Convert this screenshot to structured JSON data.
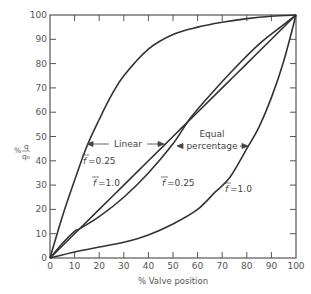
{
  "chart_data": {
    "type": "line",
    "title": "",
    "xlabel": "% Valve position",
    "ylabel": "% q/q0",
    "xlim": [
      0,
      100
    ],
    "ylim": [
      0,
      100
    ],
    "grid": false,
    "xticks": [
      0,
      10,
      20,
      30,
      40,
      50,
      60,
      70,
      80,
      90,
      100
    ],
    "yticks": [
      0,
      10,
      20,
      30,
      40,
      50,
      60,
      70,
      80,
      90,
      100
    ],
    "series": [
      {
        "name": "Linear, f=0.25",
        "group": "Linear",
        "x": [
          0,
          5,
          10,
          15,
          20,
          25,
          30,
          40,
          50,
          60,
          70,
          80,
          90,
          100
        ],
        "y": [
          0,
          17,
          32,
          46,
          57,
          67,
          75,
          86,
          92,
          95,
          97,
          98.5,
          99.5,
          100
        ]
      },
      {
        "name": "Linear, f=1.0",
        "group": "Linear",
        "x": [
          0,
          10,
          20,
          30,
          40,
          50,
          60,
          70,
          80,
          90,
          100
        ],
        "y": [
          0,
          10,
          20,
          30,
          40,
          50,
          60,
          70,
          80,
          90,
          100
        ]
      },
      {
        "name": "Equal percentage, f=0.25",
        "group": "Equal percentage",
        "x": [
          0,
          5,
          10,
          12,
          20,
          30,
          40,
          50,
          57,
          65,
          75,
          85,
          95,
          100
        ],
        "y": [
          0,
          6,
          11,
          12,
          17,
          25,
          35,
          47,
          57.5,
          67,
          78,
          88,
          96,
          100
        ]
      },
      {
        "name": "Equal percentage, f=1.0",
        "group": "Equal percentage",
        "x": [
          0,
          10,
          20,
          30,
          40,
          50,
          60,
          67,
          73,
          80,
          85,
          90,
          95,
          100
        ],
        "y": [
          0,
          2.5,
          4.5,
          6.5,
          9.5,
          14,
          20,
          27,
          33,
          45,
          54,
          66,
          81,
          100
        ]
      }
    ],
    "annotations": [
      {
        "text": "Linear",
        "x": 32,
        "y": 47.5,
        "arrows": "both"
      },
      {
        "text": "Equal",
        "x": 70,
        "y": 53
      },
      {
        "text": "percentage",
        "x": 70,
        "y": 48.5,
        "arrows": "both"
      },
      {
        "text": "f̄=0.25",
        "x": 8,
        "y": 42,
        "series": "Linear, f=0.25"
      },
      {
        "text": "f̄=1.0",
        "x": 13,
        "y": 33,
        "series": "Linear, f=1.0"
      },
      {
        "text": "f̄=0.25",
        "x": 48,
        "y": 32,
        "series": "Equal percentage, f=0.25"
      },
      {
        "text": "f̄=1.0",
        "x": 72,
        "y": 28.5,
        "series": "Equal percentage, f=1.0"
      }
    ]
  },
  "labels": {
    "xlabel": "% Valve position",
    "ylabel_pct": "%",
    "ylabel_num": "q",
    "ylabel_den": "q₀",
    "linear": "Linear",
    "equal": "Equal",
    "percentage": "percentage",
    "lin025": "=0.25",
    "lin10": "=1.0",
    "eq025": "=0.25",
    "eq10": "=1.0",
    "f": "f"
  }
}
